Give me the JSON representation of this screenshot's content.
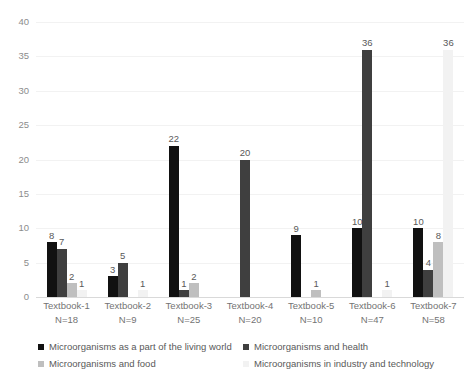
{
  "chart_data": {
    "type": "bar",
    "title": "",
    "xlabel": "",
    "ylabel": "",
    "ylim": [
      0,
      40
    ],
    "ytick_step": 5,
    "grid": true,
    "legend_position": "bottom",
    "categories": [
      "Textbook-1",
      "Textbook-2",
      "Textbook-3",
      "Textbook-4",
      "Textbook-5",
      "Textbook-6",
      "Textbook-7"
    ],
    "category_sublabels": [
      "N=18",
      "N=9",
      "N=25",
      "N=20",
      "N=10",
      "N=47",
      "N=58"
    ],
    "yticks": [
      "0",
      "5",
      "10",
      "15",
      "20",
      "25",
      "30",
      "35",
      "40"
    ],
    "series": [
      {
        "name": "Microorganisms as a part of the living world",
        "color": "#111111",
        "values": [
          8,
          3,
          22,
          null,
          9,
          10,
          10
        ]
      },
      {
        "name": "Microorganisms and health",
        "color": "#3f3f3f",
        "values": [
          7,
          5,
          1,
          20,
          null,
          36,
          4
        ]
      },
      {
        "name": "Microorganisms and food",
        "color": "#bfbfbf",
        "values": [
          2,
          null,
          2,
          null,
          1,
          null,
          8
        ]
      },
      {
        "name": "Microorganisms in industry and technology",
        "color": "#f2f2f2",
        "values": [
          1,
          1,
          null,
          null,
          null,
          1,
          36
        ]
      }
    ],
    "bar_labels": [
      [
        "8",
        "7",
        "2",
        "1"
      ],
      [
        "3",
        "5",
        "",
        "1"
      ],
      [
        "22",
        "1",
        "2",
        ""
      ],
      [
        "",
        "20",
        "",
        ""
      ],
      [
        "9",
        "",
        "1",
        ""
      ],
      [
        "10",
        "36",
        "",
        "1"
      ],
      [
        "10",
        "4",
        "8",
        "36"
      ]
    ]
  },
  "legend": {
    "items": [
      {
        "label": "Microorganisms as a part of the living world",
        "color": "#111111"
      },
      {
        "label": "Microorganisms and health",
        "color": "#3f3f3f"
      },
      {
        "label": "Microorganisms and food",
        "color": "#bfbfbf"
      },
      {
        "label": "Microorganisms in industry and technology",
        "color": "#f2f2f2"
      }
    ]
  }
}
